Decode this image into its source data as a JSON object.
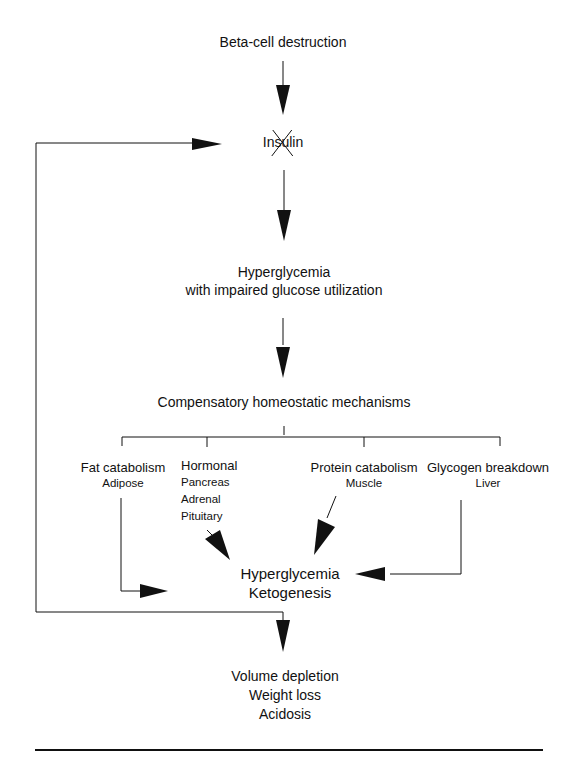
{
  "diagram": {
    "nodes": {
      "beta_cell": "Beta-cell destruction",
      "insulin": "Insulin",
      "insulin_state": "crossed-out",
      "hyperglycemia_1": "Hyperglycemia",
      "hyperglycemia_1_sub": "with impaired glucose utilization",
      "compensatory": "Compensatory homeostatic mechanisms",
      "fat": {
        "title": "Fat catabolism",
        "sub": [
          "Adipose"
        ]
      },
      "hormonal": {
        "title": "Hormonal",
        "sub": [
          "Pancreas",
          "Adrenal",
          "Pituitary"
        ]
      },
      "protein": {
        "title": "Protein catabolism",
        "sub": [
          "Muscle"
        ]
      },
      "glycogen": {
        "title": "Glycogen breakdown",
        "sub": [
          "Liver"
        ]
      },
      "hyperglycemia_2": "Hyperglycemia",
      "ketogenesis": "Ketogenesis",
      "outcomes": [
        "Volume depletion",
        "Weight loss",
        "Acidosis"
      ]
    },
    "edges": [
      {
        "from": "beta_cell",
        "to": "insulin"
      },
      {
        "from": "insulin",
        "to": "hyperglycemia_1"
      },
      {
        "from": "hyperglycemia_1",
        "to": "compensatory"
      },
      {
        "from": "compensatory",
        "to": [
          "fat",
          "hormonal",
          "protein",
          "glycogen"
        ]
      },
      {
        "from": "fat",
        "to": "hyperglycemia_2"
      },
      {
        "from": "hormonal",
        "to": "hyperglycemia_2"
      },
      {
        "from": "protein",
        "to": "hyperglycemia_2"
      },
      {
        "from": "glycogen",
        "to": "hyperglycemia_2"
      },
      {
        "from": "hyperglycemia_2",
        "to": "outcomes"
      },
      {
        "from": "hyperglycemia_2",
        "to": "insulin",
        "type": "feedback"
      }
    ],
    "colors": {
      "line": "#111111",
      "background": "#ffffff"
    }
  }
}
